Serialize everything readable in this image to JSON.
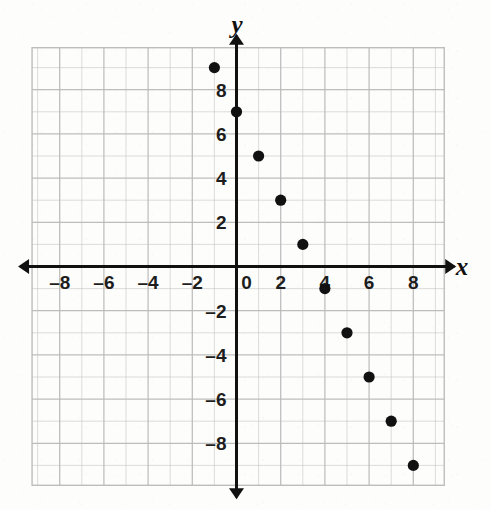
{
  "chart_data": {
    "type": "scatter",
    "title": "",
    "xlabel": "x",
    "ylabel": "y",
    "xlim": [
      -10,
      10
    ],
    "ylim": [
      -10,
      10
    ],
    "grid": true,
    "legend": false,
    "x_tick_labels": [
      "-8",
      "-6",
      "-4",
      "-2",
      "0",
      "2",
      "4",
      "6",
      "8"
    ],
    "x_tick_values": [
      -8,
      -6,
      -4,
      -2,
      0,
      2,
      4,
      6,
      8
    ],
    "y_tick_labels": [
      "8",
      "6",
      "4",
      "2",
      "-2",
      "-4",
      "-6",
      "-8"
    ],
    "y_tick_values": [
      8,
      6,
      4,
      2,
      -2,
      -4,
      -6,
      -8
    ],
    "origin_label": "0",
    "point_color": "#111111",
    "axis_color": "#111111",
    "grid_color": "#b9b9b9",
    "points": [
      {
        "x": -1,
        "y": 9
      },
      {
        "x": 0,
        "y": 7
      },
      {
        "x": 1,
        "y": 5
      },
      {
        "x": 2,
        "y": 3
      },
      {
        "x": 3,
        "y": 1
      },
      {
        "x": 4,
        "y": -1
      },
      {
        "x": 5,
        "y": -3
      },
      {
        "x": 6,
        "y": -5
      },
      {
        "x": 7,
        "y": -7
      },
      {
        "x": 8,
        "y": -9
      }
    ]
  }
}
